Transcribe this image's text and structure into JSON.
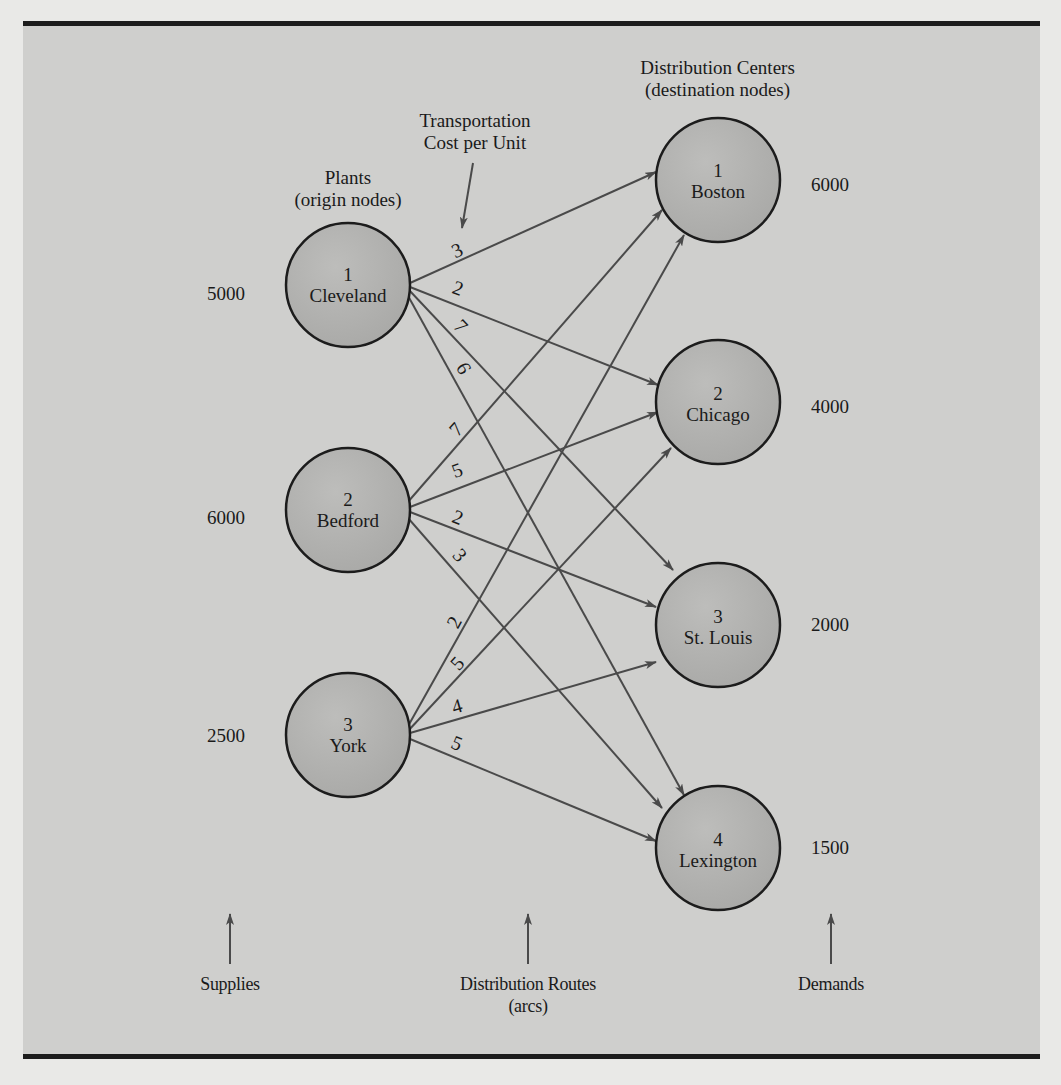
{
  "headers": {
    "plants": [
      "Plants",
      "(origin nodes)"
    ],
    "distribution_centers": [
      "Distribution Centers",
      "(destination nodes)"
    ],
    "transport_cost": [
      "Transportation",
      "Cost per Unit"
    ]
  },
  "origins": [
    {
      "id": "1",
      "name": "Cleveland",
      "supply": "5000"
    },
    {
      "id": "2",
      "name": "Bedford",
      "supply": "6000"
    },
    {
      "id": "3",
      "name": "York",
      "supply": "2500"
    }
  ],
  "destinations": [
    {
      "id": "1",
      "name": "Boston",
      "demand": "6000"
    },
    {
      "id": "2",
      "name": "Chicago",
      "demand": "4000"
    },
    {
      "id": "3",
      "name": "St. Louis",
      "demand": "2000"
    },
    {
      "id": "4",
      "name": "Lexington",
      "demand": "1500"
    }
  ],
  "arcs": [
    {
      "from": "Cleveland",
      "to": "Boston",
      "cost": "3"
    },
    {
      "from": "Cleveland",
      "to": "Chicago",
      "cost": "2"
    },
    {
      "from": "Cleveland",
      "to": "St. Louis",
      "cost": "7"
    },
    {
      "from": "Cleveland",
      "to": "Lexington",
      "cost": "6"
    },
    {
      "from": "Bedford",
      "to": "Boston",
      "cost": "7"
    },
    {
      "from": "Bedford",
      "to": "Chicago",
      "cost": "5"
    },
    {
      "from": "Bedford",
      "to": "St. Louis",
      "cost": "2"
    },
    {
      "from": "Bedford",
      "to": "Lexington",
      "cost": "3"
    },
    {
      "from": "York",
      "to": "Boston",
      "cost": "2"
    },
    {
      "from": "York",
      "to": "Chicago",
      "cost": "5"
    },
    {
      "from": "York",
      "to": "St. Louis",
      "cost": "4"
    },
    {
      "from": "York",
      "to": "Lexington",
      "cost": "5"
    }
  ],
  "footer": {
    "supplies": "Supplies",
    "routes": [
      "Distribution Routes",
      "(arcs)"
    ],
    "demands": "Demands"
  },
  "colors": {
    "panel": "#cfcfcd",
    "node_fill": "#b5b5b3",
    "edge": "#4a4a4a",
    "rule": "#1c1c1c"
  }
}
